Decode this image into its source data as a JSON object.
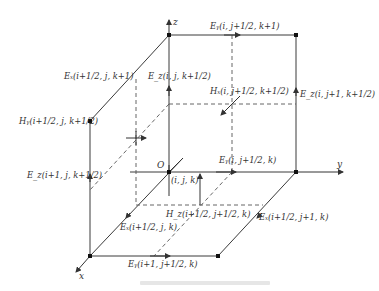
{
  "figure": {
    "type": "Yee cell (FDTD unit cell) diagram",
    "axes": {
      "x": "x",
      "y": "y",
      "z": "z",
      "origin": "O"
    },
    "origin_index": "(i, j, k)",
    "labels": {
      "ey_top": "Eᵧ(i, j+1/2, k+1)",
      "ex_top": "Eₓ(i+1/2, j, k+1)",
      "ez_back_left": "E_z(i, j, k+1/2)",
      "hx": "Hₓ(i, j+1/2, k+1/2)",
      "ez_back_right": "E_z(i, j+1, k+1/2)",
      "hy": "Hᵧ(i+1/2, j, k+1/2)",
      "ez_front_left": "E_z(i+1, j, k+1/2)",
      "ey_bottom_back": "Eᵧ(i, j+1/2, k)",
      "hz": "H_z(i+1/2, j+1/2, k)",
      "ex_bottom_left": "Eₓ(i+1/2, j, k)",
      "ex_bottom_right": "Eₓ(i+1/2, j+1, k)",
      "ey_bottom_front": "Eᵧ(i+1, j+1/2, k)"
    },
    "caption": ""
  },
  "colors": {
    "line": "#3a3a3a",
    "dash": "#555555",
    "text": "#333333",
    "background": "#ffffff"
  }
}
